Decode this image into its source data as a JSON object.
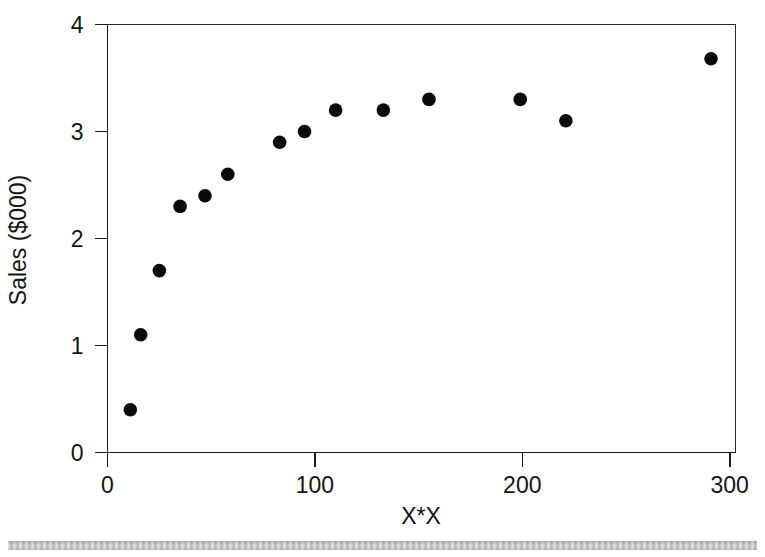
{
  "chart_data": {
    "type": "scatter",
    "title": "",
    "xlabel": "X*X",
    "ylabel": "Sales ($000)",
    "xlim": [
      -5,
      305
    ],
    "ylim": [
      0,
      4
    ],
    "xticks": [
      0,
      100,
      200,
      300
    ],
    "xtick_labels": [
      "0",
      "100",
      "200",
      "300"
    ],
    "yticks": [
      0,
      1,
      2,
      3,
      4
    ],
    "ytick_labels": [
      "0",
      "1",
      "2",
      "3",
      "4"
    ],
    "grid": false,
    "legend": null,
    "marker": {
      "shape": "circle",
      "color": "#0a0a0a",
      "size_px": 7
    },
    "series": [
      {
        "name": "Sales vs X*X",
        "points": [
          {
            "x": 11,
            "y": 0.4
          },
          {
            "x": 16,
            "y": 1.1
          },
          {
            "x": 25,
            "y": 1.7
          },
          {
            "x": 35,
            "y": 2.3
          },
          {
            "x": 47,
            "y": 2.4
          },
          {
            "x": 58,
            "y": 2.6
          },
          {
            "x": 83,
            "y": 2.9
          },
          {
            "x": 95,
            "y": 3.0
          },
          {
            "x": 110,
            "y": 3.2
          },
          {
            "x": 133,
            "y": 3.2
          },
          {
            "x": 155,
            "y": 3.3
          },
          {
            "x": 199,
            "y": 3.3
          },
          {
            "x": 221,
            "y": 3.1
          },
          {
            "x": 291,
            "y": 3.68
          }
        ]
      }
    ]
  },
  "figure": {
    "background_color": "#ffffff",
    "axis_color": "#1b1b1b",
    "scan_bar_color": "#b8b8b8"
  }
}
